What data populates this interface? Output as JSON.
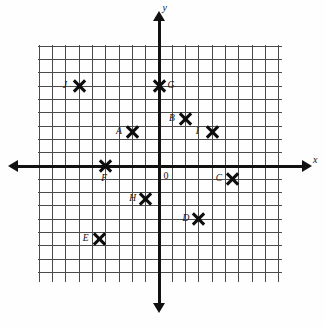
{
  "figure": {
    "type": "coordinate-plane",
    "origin_label": "0",
    "x_axis_label": "x",
    "y_axis_label": "y"
  },
  "chart_data": {
    "type": "scatter",
    "title": "",
    "xlabel": "x",
    "ylabel": "y",
    "grid": true,
    "legend": "none",
    "xlim": [
      -9,
      9.3
    ],
    "ylim": [
      -8.8,
      9
    ],
    "origin_label": "0",
    "labels": [
      "A",
      "B",
      "C",
      "D",
      "E",
      "F",
      "G",
      "H",
      "I",
      "J"
    ],
    "x": [
      -2,
      2,
      5.5,
      3,
      -4.5,
      -4,
      0,
      -1,
      4,
      -6
    ],
    "y": [
      2.5,
      3.5,
      -1,
      -4,
      -5.5,
      0,
      6,
      -2.5,
      2.5,
      6
    ],
    "points": [
      {
        "label": "A",
        "x": -2,
        "y": 2.5,
        "label_side": "left"
      },
      {
        "label": "B",
        "x": 2,
        "y": 3.5,
        "label_side": "left"
      },
      {
        "label": "C",
        "x": 5.5,
        "y": -1,
        "label_side": "left"
      },
      {
        "label": "D",
        "x": 3,
        "y": -4,
        "label_side": "left"
      },
      {
        "label": "E",
        "x": -4.5,
        "y": -5.5,
        "label_side": "left"
      },
      {
        "label": "F",
        "x": -4,
        "y": 0,
        "label_side": "below"
      },
      {
        "label": "G",
        "x": 0,
        "y": 6,
        "label_side": "right"
      },
      {
        "label": "H",
        "x": -1,
        "y": -2.5,
        "label_side": "left"
      },
      {
        "label": "I",
        "x": 4,
        "y": 2.5,
        "label_side": "left"
      },
      {
        "label": "J",
        "x": -6,
        "y": 6,
        "label_side": "left"
      }
    ]
  }
}
